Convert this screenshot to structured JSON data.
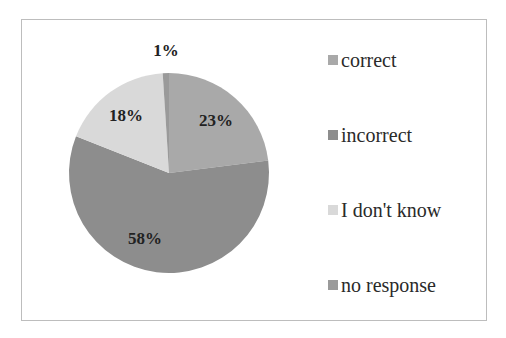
{
  "chart_data": {
    "type": "pie",
    "title": "",
    "categories": [
      "correct",
      "incorrect",
      "I don't know",
      "no response"
    ],
    "values": [
      23,
      58,
      18,
      1
    ],
    "value_labels": [
      "23%",
      "58%",
      "18%",
      "1%"
    ],
    "colors": [
      "#a9a9a9",
      "#8d8d8d",
      "#d9d9d9",
      "#9a9a9a"
    ],
    "legend_position": "right",
    "start_angle_deg": 0,
    "direction": "clockwise"
  },
  "legend": {
    "items": [
      {
        "label": "correct",
        "color": "#a9a9a9"
      },
      {
        "label": "incorrect",
        "color": "#8d8d8d"
      },
      {
        "label": "I don't know",
        "color": "#d9d9d9"
      },
      {
        "label": "no response",
        "color": "#9a9a9a"
      }
    ]
  },
  "labels": {
    "correct": "23%",
    "incorrect": "58%",
    "dont_know": "18%",
    "no_response": "1%"
  }
}
